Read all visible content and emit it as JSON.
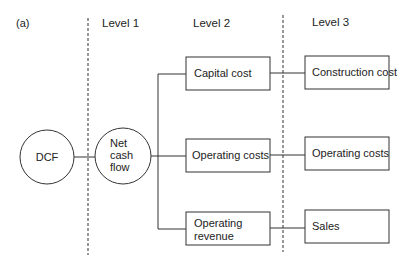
{
  "panel_label": "(a)",
  "levels": [
    {
      "label": "Level 1"
    },
    {
      "label": "Level 2"
    },
    {
      "label": "Level 3"
    }
  ],
  "root": {
    "label": "DCF"
  },
  "level1": {
    "lines": [
      "Net",
      "cash",
      "flow"
    ]
  },
  "level2": [
    {
      "lines": [
        "Capital cost"
      ]
    },
    {
      "lines": [
        "Operating costs"
      ]
    },
    {
      "lines": [
        "Operating",
        "revenue"
      ]
    }
  ],
  "level3": [
    {
      "lines": [
        "Construction cost"
      ]
    },
    {
      "lines": [
        "Operating costs"
      ]
    },
    {
      "lines": [
        "Sales"
      ]
    }
  ],
  "colors": {
    "stroke": "#333333",
    "text": "#222222",
    "background": "#ffffff"
  }
}
